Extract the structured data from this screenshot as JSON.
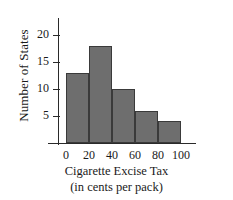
{
  "chart_data": {
    "type": "bar",
    "title": "",
    "xlabel": "Cigarette Excise Tax",
    "xlabel_sub": "(in cents per pack)",
    "ylabel": "Number of States",
    "categories": [
      "0-20",
      "20-40",
      "40-60",
      "60-80",
      "80-100"
    ],
    "bin_edges": [
      0,
      20,
      40,
      60,
      80,
      100
    ],
    "values": [
      13,
      18,
      10,
      6,
      4
    ],
    "xticks": [
      "0",
      "20",
      "40",
      "60",
      "80",
      "100"
    ],
    "xtick_values": [
      0,
      20,
      40,
      60,
      80,
      100
    ],
    "yticks": [
      "5",
      "10",
      "15",
      "20"
    ],
    "ytick_values": [
      5,
      10,
      15,
      20
    ],
    "xlim": [
      0,
      100
    ],
    "ylim": [
      0,
      21
    ],
    "grid": false,
    "legend": false,
    "bar_color": "#6e6e6e",
    "bar_edge_color": "#3a3a3a",
    "axis_color": "#2a2a2a"
  }
}
